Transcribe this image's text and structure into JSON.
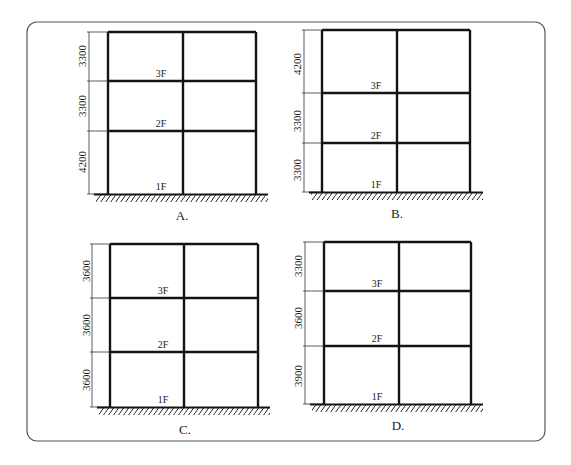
{
  "figure": {
    "colors": {
      "frame": "#141414",
      "dimension": "#333333",
      "border": "#555555",
      "background": "#ffffff"
    },
    "panels": [
      {
        "id": "A",
        "caption": "A.",
        "storeys_bottom_to_top": [
          {
            "floor_label": "1F",
            "height": "4200"
          },
          {
            "floor_label": "2F",
            "height": "3300"
          },
          {
            "floor_label": "3F",
            "height": "3300"
          }
        ]
      },
      {
        "id": "B",
        "caption": "B.",
        "storeys_bottom_to_top": [
          {
            "floor_label": "1F",
            "height": "3300"
          },
          {
            "floor_label": "2F",
            "height": "3300"
          },
          {
            "floor_label": "3F",
            "height": "4200"
          }
        ]
      },
      {
        "id": "C",
        "caption": "C.",
        "storeys_bottom_to_top": [
          {
            "floor_label": "1F",
            "height": "3600"
          },
          {
            "floor_label": "2F",
            "height": "3600"
          },
          {
            "floor_label": "3F",
            "height": "3600"
          }
        ]
      },
      {
        "id": "D",
        "caption": "D.",
        "storeys_bottom_to_top": [
          {
            "floor_label": "1F",
            "height": "3900"
          },
          {
            "floor_label": "2F",
            "height": "3600"
          },
          {
            "floor_label": "3F",
            "height": "3300"
          }
        ]
      }
    ]
  }
}
